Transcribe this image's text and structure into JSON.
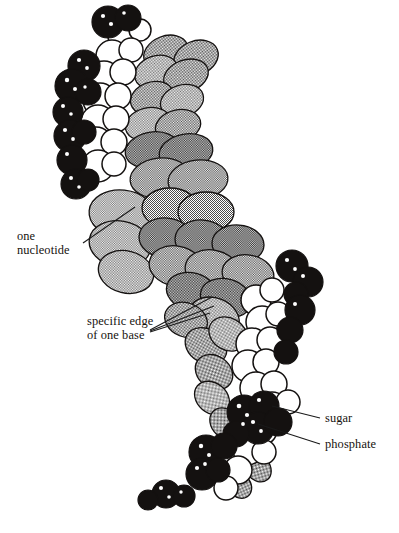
{
  "figure": {
    "background_color": "#ffffff",
    "palette": {
      "phosphate_black": "#141110",
      "sugar_white": "#ffffff",
      "base_gray": "#9a9a9a",
      "outline": "#141110",
      "highlight": "#ffffff",
      "label_text": "#16120e",
      "leader_line": "#1a1a1a"
    },
    "labels": {
      "one_nucleotide": "one\nnucleotide",
      "one_nucleotide_line1": "one",
      "one_nucleotide_line2": "nucleotide",
      "specific_edge": "specific edge\nof one base",
      "specific_edge_line1": "specific edge",
      "specific_edge_line2": "of one base",
      "sugar": "sugar",
      "phosphate": "phosphate"
    },
    "caption_partial": "",
    "components": [
      {
        "name": "phosphate",
        "color": "#141110",
        "description": "black spheres forming the backbone"
      },
      {
        "name": "sugar",
        "color": "#ffffff",
        "description": "white spheres forming the backbone"
      },
      {
        "name": "base",
        "color": "#9a9a9a",
        "description": "gray hatched discs stacked in the core"
      }
    ]
  }
}
